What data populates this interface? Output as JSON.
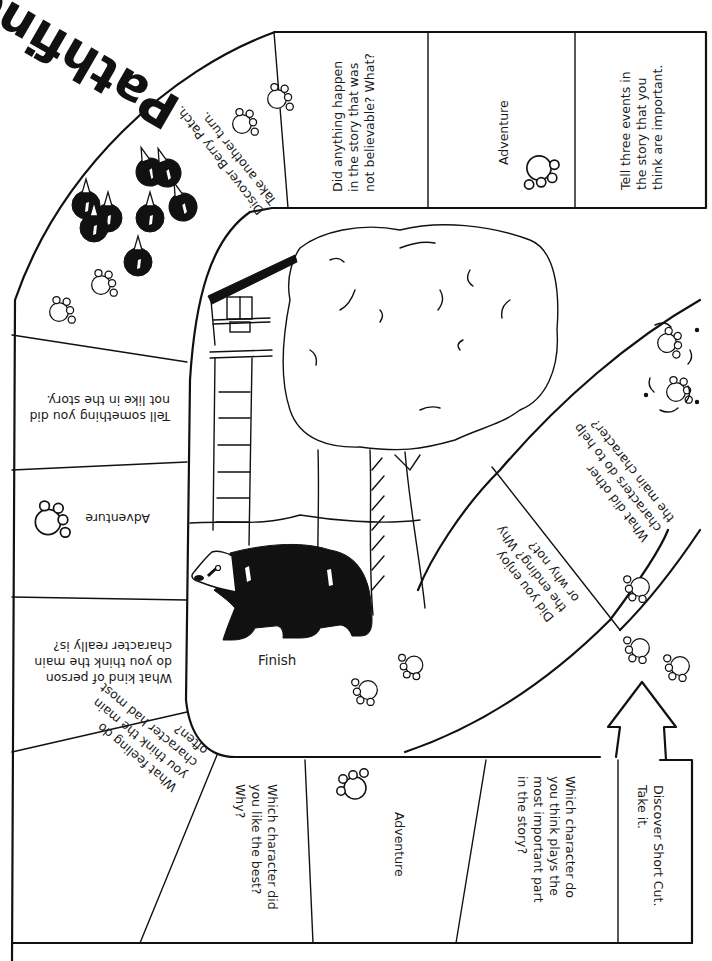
{
  "game": {
    "title": "Pathfinder",
    "finish_label": "Finish",
    "colors": {
      "ink": "#111111",
      "paper": "#ffffff"
    }
  },
  "spaces": [
    {
      "id": "short-cut",
      "text": "Discover Short Cut.\nTake it.",
      "orientation": "rotated-90-cw"
    },
    {
      "id": "important-character",
      "text": "Which character do\nyou think plays the\nmost important part\nin the story?",
      "orientation": "rotated-90-cw"
    },
    {
      "id": "adventure-1",
      "text": "Adventure",
      "orientation": "rotated-90-cw",
      "icon": "paw-print-icon"
    },
    {
      "id": "like-best",
      "text": "Which character did\nyou like the best?\nWhy?",
      "orientation": "rotated-90-cw"
    },
    {
      "id": "feeling",
      "text": "What feeling do\nyou think the main\ncharacter had most\noften?",
      "orientation": "upside-down-angled"
    },
    {
      "id": "kind-of-person",
      "text": "What kind of person\ndo you think the main\ncharacter really is?",
      "orientation": "upside-down"
    },
    {
      "id": "adventure-2",
      "text": "Adventure",
      "orientation": "upside-down",
      "icon": "paw-print-icon"
    },
    {
      "id": "did-not-like",
      "text": "Tell something you did\nnot like in the story.",
      "orientation": "upside-down"
    },
    {
      "id": "berry-patch",
      "text": "Discover Berry Patch.\nTake another turn.",
      "orientation": "upside-down-angled",
      "icon": "berries-icon"
    },
    {
      "id": "not-believable",
      "text": "Did anything happen\nin the story that was\nnot believable? What?",
      "orientation": "rotated-90-ccw"
    },
    {
      "id": "adventure-3",
      "text": "Adventure",
      "orientation": "rotated-90-ccw",
      "icon": "paw-print-icon"
    },
    {
      "id": "three-events",
      "text": "Tell three events in\nthe story that you\nthink are important.",
      "orientation": "rotated-90-ccw"
    }
  ],
  "shortcut_path": [
    {
      "id": "other-characters",
      "text": "What did other\ncharacters do to help\nthe main character?",
      "orientation": "upside-down-angled"
    },
    {
      "id": "enjoy-ending",
      "text": "Did you enjoy\nthe ending? Why\nor why not?",
      "orientation": "upside-down-angled"
    }
  ],
  "illustration": {
    "description": "Bear walking beneath a large tree with a treehouse and ladder",
    "elements": [
      "bear",
      "tree",
      "treehouse",
      "ladder"
    ]
  }
}
